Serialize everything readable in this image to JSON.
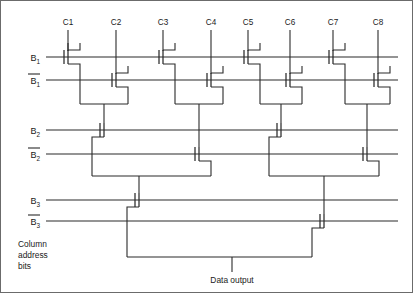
{
  "figure": {
    "title_visible": false,
    "type": "mos-column-decoder-tree",
    "colors": {
      "wire": "#2b2b2b",
      "frame": "#6b6b6b",
      "background": "#ffffff",
      "text": "#1a1a1a"
    },
    "column_labels": [
      "C1",
      "C2",
      "C3",
      "C4",
      "C5",
      "C6",
      "C7",
      "C8"
    ],
    "column_x": [
      68,
      116,
      163,
      211,
      248,
      290,
      333,
      378
    ],
    "bit_lines": [
      {
        "name": "B1",
        "base": "B",
        "sub": "1",
        "overbar": false,
        "y": 57,
        "label_x": 40
      },
      {
        "name": "B1b",
        "base": "B",
        "sub": "1",
        "overbar": true,
        "y": 80,
        "label_x": 40
      },
      {
        "name": "B2",
        "base": "B",
        "sub": "2",
        "overbar": false,
        "y": 130,
        "label_x": 40
      },
      {
        "name": "B2b",
        "base": "B",
        "sub": "2",
        "overbar": true,
        "y": 154,
        "label_x": 40
      },
      {
        "name": "B3",
        "base": "B",
        "sub": "3",
        "overbar": false,
        "y": 200,
        "label_x": 40
      },
      {
        "name": "B3b",
        "base": "B",
        "sub": "3",
        "overbar": true,
        "y": 221,
        "label_x": 40
      }
    ],
    "caption_lines": [
      "Column",
      "address",
      "bits"
    ],
    "caption_x": 18,
    "caption_y": 247,
    "output_label": "Data output",
    "output_label_x": 232,
    "output_label_y": 283,
    "output_stub": {
      "x": 232,
      "y_top": 257,
      "y_bottom": 272
    },
    "bit_line_x_start": 46,
    "bit_line_x_end": 398,
    "level1_merge_y": 104,
    "level2_merge_y": 176,
    "level3_merge_y": 257,
    "stage1": [
      {
        "col": "C1",
        "line": "B1",
        "gate_x": 68,
        "y": 57,
        "drain_x": 80,
        "side": "right"
      },
      {
        "col": "C2",
        "line": "B1b",
        "gate_x": 116,
        "y": 80,
        "drain_x": 128,
        "side": "right"
      },
      {
        "col": "C3",
        "line": "B1",
        "gate_x": 163,
        "y": 57,
        "drain_x": 175,
        "side": "right"
      },
      {
        "col": "C4",
        "line": "B1b",
        "gate_x": 211,
        "y": 80,
        "drain_x": 223,
        "side": "right"
      },
      {
        "col": "C5",
        "line": "B1",
        "gate_x": 248,
        "y": 57,
        "drain_x": 260,
        "side": "right"
      },
      {
        "col": "C6",
        "line": "B1b",
        "gate_x": 290,
        "y": 80,
        "drain_x": 302,
        "side": "right"
      },
      {
        "col": "C7",
        "line": "B1",
        "gate_x": 333,
        "y": 57,
        "drain_x": 345,
        "side": "right"
      },
      {
        "col": "C8",
        "line": "B1b",
        "gate_x": 378,
        "y": 80,
        "drain_x": 390,
        "side": "right"
      }
    ],
    "stage1_pairs": [
      {
        "left_x": 80,
        "right_x": 128,
        "merge_y": 104,
        "node_x": 104
      },
      {
        "left_x": 175,
        "right_x": 223,
        "merge_y": 104,
        "node_x": 199
      },
      {
        "left_x": 260,
        "right_x": 302,
        "merge_y": 104,
        "node_x": 281
      },
      {
        "left_x": 345,
        "right_x": 390,
        "merge_y": 104,
        "node_x": 367
      }
    ],
    "stage2": [
      {
        "line": "B2",
        "gate_x": 104,
        "y": 130,
        "drain_x": 92,
        "node_x": 104
      },
      {
        "line": "B2b",
        "gate_x": 199,
        "y": 154,
        "drain_x": 211,
        "node_x": 199
      },
      {
        "line": "B2",
        "gate_x": 281,
        "y": 130,
        "drain_x": 269,
        "node_x": 281
      },
      {
        "line": "B2b",
        "gate_x": 367,
        "y": 154,
        "drain_x": 379,
        "node_x": 367
      }
    ],
    "stage2_pairs": [
      {
        "left_x": 92,
        "right_x": 211,
        "merge_y": 176,
        "node_x": 139
      },
      {
        "left_x": 269,
        "right_x": 379,
        "merge_y": 176,
        "node_x": 324
      }
    ],
    "stage3": [
      {
        "line": "B3",
        "gate_x": 139,
        "y": 200,
        "drain_x": 127,
        "node_x": 139
      },
      {
        "line": "B3b",
        "gate_x": 324,
        "y": 221,
        "drain_x": 312,
        "node_x": 324
      }
    ],
    "stage3_pair": {
      "left_x": 127,
      "right_x": 312,
      "merge_y": 257
    }
  }
}
